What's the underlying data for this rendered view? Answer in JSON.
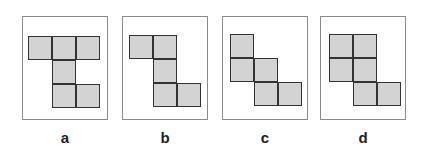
{
  "figure": {
    "cell_size": 24,
    "fill_color": "#d3d3d3",
    "stroke_color": "#333333",
    "frame_color": "#8a8a8a",
    "panels": [
      {
        "label": "a",
        "frame_left": 22,
        "origin": [
          5,
          19
        ],
        "cells": [
          [
            0,
            0
          ],
          [
            1,
            0
          ],
          [
            2,
            0
          ],
          [
            1,
            1
          ],
          [
            1,
            2
          ],
          [
            2,
            2
          ]
        ]
      },
      {
        "label": "b",
        "frame_left": 122,
        "origin": [
          6,
          18
        ],
        "cells": [
          [
            0,
            0
          ],
          [
            1,
            0
          ],
          [
            1,
            1
          ],
          [
            1,
            2
          ],
          [
            2,
            2
          ]
        ]
      },
      {
        "label": "c",
        "frame_left": 222,
        "origin": [
          7,
          17
        ],
        "cells": [
          [
            0,
            0
          ],
          [
            0,
            1
          ],
          [
            1,
            1
          ],
          [
            1,
            2
          ],
          [
            2,
            2
          ]
        ]
      },
      {
        "label": "d",
        "frame_left": 320,
        "origin": [
          8,
          17
        ],
        "cells": [
          [
            0,
            0
          ],
          [
            1,
            0
          ],
          [
            0,
            1
          ],
          [
            1,
            1
          ],
          [
            1,
            2
          ],
          [
            2,
            2
          ]
        ]
      }
    ]
  }
}
